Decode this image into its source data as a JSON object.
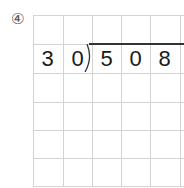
{
  "problem": {
    "label": "④",
    "divisor": [
      "3",
      "0"
    ],
    "dividend": [
      "5",
      "0",
      "8"
    ]
  },
  "grid": {
    "columns": 5,
    "rows": 6,
    "line_color": "#d3d3d3"
  }
}
